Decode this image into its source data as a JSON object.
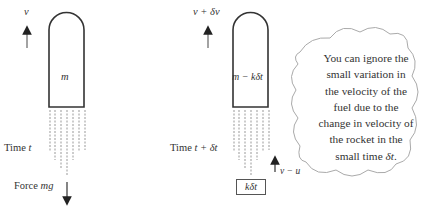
{
  "left_rocket": {
    "velocity_label": "v",
    "mass_label": "m",
    "time_label_prefix": "Time ",
    "time_label_var": "t",
    "force_label_prefix": "Force ",
    "force_label_var": "mg"
  },
  "right_rocket": {
    "velocity_label": "v + δv",
    "mass_label": "m − kδt",
    "time_label_prefix": "Time ",
    "time_label_var": "t + δt",
    "fuel_velocity_label": "v − u",
    "fuel_mass_label": "kδt"
  },
  "note": {
    "lines": [
      "You can ignore the",
      "small variation in",
      "the velocity of the",
      "fuel due to the",
      "change in velocity of",
      "the rocket in the"
    ],
    "last_line_prefix": "small time ",
    "last_line_var": "δt",
    "last_line_suffix": "."
  }
}
